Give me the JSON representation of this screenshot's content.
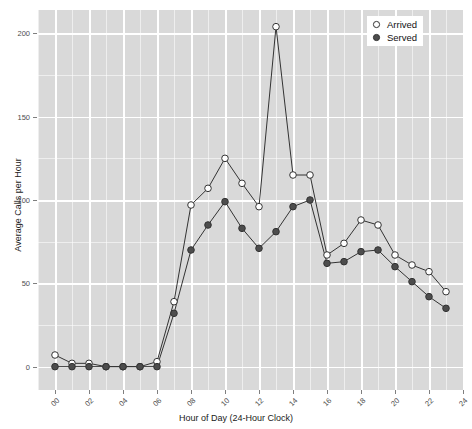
{
  "chart_data": {
    "type": "line",
    "title": "",
    "xlabel": "Hour of Day (24-Hour Clock)",
    "ylabel": "Average Calls per Hour",
    "x": [
      0,
      1,
      2,
      3,
      4,
      5,
      6,
      7,
      8,
      9,
      10,
      11,
      12,
      13,
      14,
      15,
      16,
      17,
      18,
      19,
      20,
      21,
      22,
      23
    ],
    "xlim": [
      -1,
      24
    ],
    "ylim": [
      -14,
      214
    ],
    "x_ticks": [
      0,
      2,
      4,
      6,
      8,
      10,
      12,
      14,
      16,
      18,
      20,
      22,
      24
    ],
    "x_tick_labels": [
      "00",
      "02",
      "04",
      "06",
      "08",
      "10",
      "12",
      "14",
      "16",
      "18",
      "20",
      "22",
      "24"
    ],
    "y_ticks": [
      0,
      50,
      100,
      150,
      200
    ],
    "y_tick_labels": [
      "0",
      "50",
      "100",
      "150",
      "200"
    ],
    "grid": true,
    "grid_major_color": "#ffffff",
    "panel_color": "#d9d9d9",
    "legend_position": "top-right",
    "series": [
      {
        "name": "Arrived",
        "marker": "open-circle",
        "color": "#333333",
        "fill": "#ffffff",
        "values": [
          7,
          2,
          2,
          0,
          0,
          0,
          3,
          39,
          97,
          107,
          125,
          110,
          96,
          204,
          115,
          115,
          67,
          74,
          88,
          85,
          67,
          61,
          57,
          45
        ]
      },
      {
        "name": "Served",
        "marker": "filled-circle",
        "color": "#333333",
        "fill": "#4d4d4d",
        "values": [
          0,
          0,
          0,
          0,
          0,
          0,
          0,
          32,
          70,
          85,
          99,
          83,
          71,
          81,
          96,
          100,
          62,
          63,
          69,
          70,
          60,
          51,
          42,
          35
        ]
      }
    ]
  },
  "legend": {
    "entries": [
      {
        "label": "Arrived",
        "marker": "open-circle"
      },
      {
        "label": "Served",
        "marker": "filled-circle"
      }
    ]
  }
}
